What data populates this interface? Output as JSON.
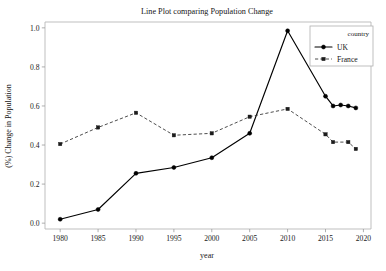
{
  "chart_data": {
    "type": "line",
    "title": "Line Plot comparing Population Change",
    "xlabel": "year",
    "ylabel": "(%) Change in Population",
    "xlim": [
      1978.0,
      2021.0
    ],
    "ylim": [
      -0.03,
      1.03
    ],
    "xticks": [
      1980,
      1985,
      1990,
      1995,
      2000,
      2005,
      2010,
      2015,
      2020
    ],
    "xticklabels": [
      "1980",
      "1985",
      "1990",
      "1995",
      "2000",
      "2005",
      "2010",
      "2015",
      "2020"
    ],
    "yticks": [
      0.0,
      0.2,
      0.4,
      0.6,
      0.8,
      1.0
    ],
    "yticklabels": [
      "0.0",
      "0.2",
      "0.4",
      "0.6",
      "0.8",
      "1.0"
    ],
    "grid": false,
    "legend": {
      "title": "country",
      "position": "upper right",
      "entries": [
        "UK",
        "France"
      ]
    },
    "series": [
      {
        "name": "UK",
        "linestyle": "solid",
        "marker": "circle",
        "color": "#000000",
        "x": [
          1980,
          1985,
          1990,
          1995,
          2000,
          2005,
          2010,
          2015,
          2016,
          2017,
          2018,
          2019
        ],
        "values": [
          0.02,
          0.07,
          0.255,
          0.285,
          0.335,
          0.46,
          0.985,
          0.65,
          0.6,
          0.605,
          0.6,
          0.59
        ]
      },
      {
        "name": "France",
        "linestyle": "dashed",
        "marker": "square",
        "color": "#1c1c1c",
        "x": [
          1980,
          1985,
          1990,
          1995,
          2000,
          2005,
          2010,
          2015,
          2016,
          2018,
          2019
        ],
        "values": [
          0.405,
          0.49,
          0.565,
          0.45,
          0.46,
          0.545,
          0.585,
          0.455,
          0.415,
          0.415,
          0.38
        ]
      }
    ]
  }
}
